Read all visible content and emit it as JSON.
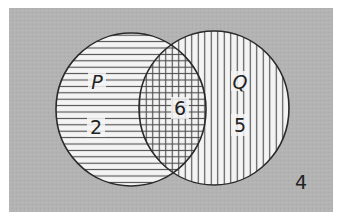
{
  "diagram": {
    "type": "venn",
    "universe": {
      "count": "4",
      "background_color": "#b3b3b3"
    },
    "sets": [
      {
        "name": "P",
        "only_count": "2",
        "hatch": "horizontal",
        "fill_color": "#f4f4f4",
        "stroke_color": "#2a2a2a"
      },
      {
        "name": "Q",
        "only_count": "5",
        "hatch": "vertical",
        "fill_color": "#f4f4f4",
        "stroke_color": "#2a2a2a"
      }
    ],
    "intersection": {
      "label": "P ∩ Q",
      "count": "6",
      "hatch": "cross"
    },
    "colors": {
      "page_background": "#ffffff",
      "hatch_line": "#444444",
      "text": "#222222"
    }
  }
}
